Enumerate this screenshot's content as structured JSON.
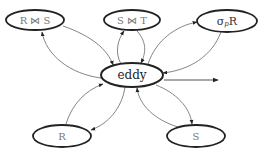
{
  "diagram": {
    "type": "eddy-routing-diagram",
    "center": {
      "id": "eddy",
      "label": "eddy"
    },
    "nodes": [
      {
        "id": "rs_join",
        "label": "R ⋈ S"
      },
      {
        "id": "st_join",
        "label": "S ⋈ T"
      },
      {
        "id": "select_r",
        "label": "σ",
        "sub": "p",
        "suffix": "R"
      },
      {
        "id": "r",
        "label": "R"
      },
      {
        "id": "s",
        "label": "S"
      }
    ],
    "edges": [
      {
        "from": "rs_join",
        "to": "eddy"
      },
      {
        "from": "eddy",
        "to": "rs_join"
      },
      {
        "from": "st_join",
        "to": "eddy"
      },
      {
        "from": "eddy",
        "to": "st_join"
      },
      {
        "from": "select_r",
        "to": "eddy"
      },
      {
        "from": "eddy",
        "to": "select_r"
      },
      {
        "from": "r",
        "to": "eddy"
      },
      {
        "from": "eddy",
        "to": "r"
      },
      {
        "from": "s",
        "to": "eddy"
      },
      {
        "from": "eddy",
        "to": "s"
      },
      {
        "from": "eddy",
        "to": "output"
      }
    ]
  }
}
